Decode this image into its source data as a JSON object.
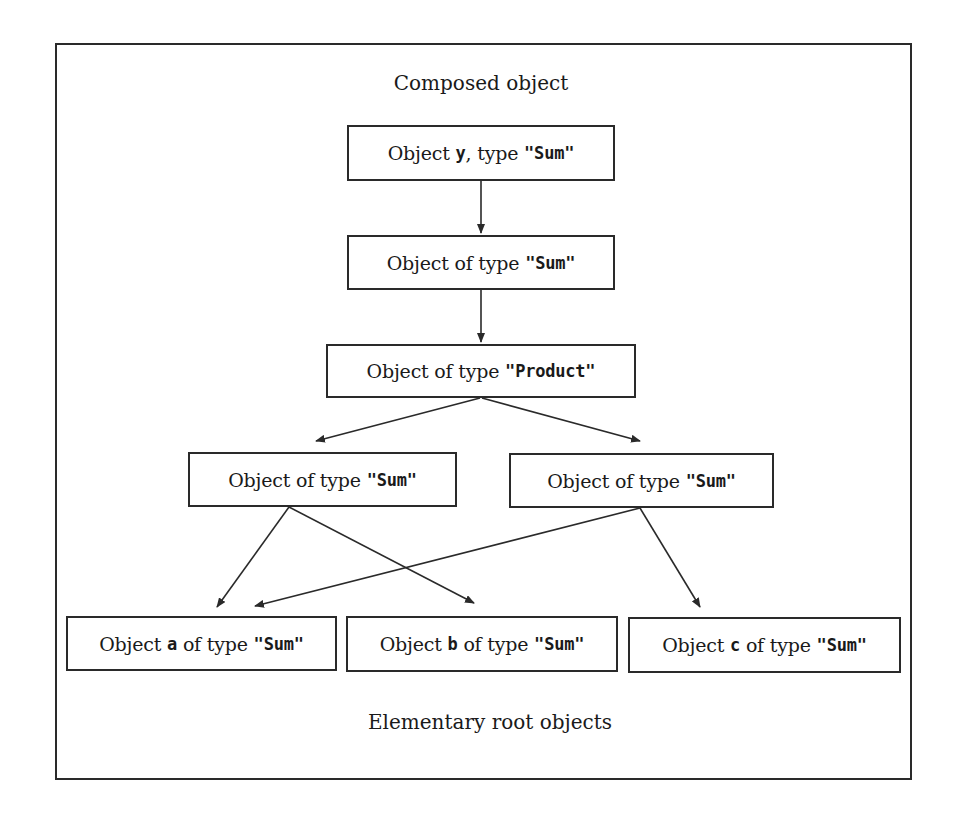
{
  "diagram": {
    "top_label": "Composed object",
    "bottom_label": "Elementary root objects",
    "nodes": [
      {
        "id": "y",
        "prefix": "Object ",
        "var": "y",
        "mid": ", type ",
        "type": "\"Sum\""
      },
      {
        "id": "sum1",
        "prefix": "Object of type ",
        "var": "",
        "mid": "",
        "type": "\"Sum\""
      },
      {
        "id": "product",
        "prefix": "Object of type ",
        "var": "",
        "mid": "",
        "type": "\"Product\""
      },
      {
        "id": "sumL",
        "prefix": "Object of type ",
        "var": "",
        "mid": "",
        "type": "\"Sum\""
      },
      {
        "id": "sumR",
        "prefix": "Object of type ",
        "var": "",
        "mid": "",
        "type": "\"Sum\""
      },
      {
        "id": "a",
        "prefix": "Object ",
        "var": "a",
        "mid": " of type ",
        "type": "\"Sum\""
      },
      {
        "id": "b",
        "prefix": "Object ",
        "var": "b",
        "mid": " of type ",
        "type": "\"Sum\""
      },
      {
        "id": "c",
        "prefix": "Object ",
        "var": "c",
        "mid": " of type ",
        "type": "\"Sum\""
      }
    ],
    "edges": [
      {
        "from": "y",
        "to": "sum1"
      },
      {
        "from": "sum1",
        "to": "product"
      },
      {
        "from": "product",
        "to": "sumL"
      },
      {
        "from": "product",
        "to": "sumR"
      },
      {
        "from": "sumL",
        "to": "a"
      },
      {
        "from": "sumL",
        "to": "b"
      },
      {
        "from": "sumR",
        "to": "a"
      },
      {
        "from": "sumR",
        "to": "c"
      }
    ]
  }
}
